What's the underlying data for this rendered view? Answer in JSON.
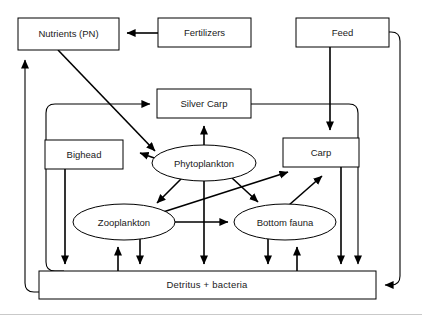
{
  "diagram": {
    "type": "flow-diagram",
    "background": "#ffffff",
    "line_color": "#000000",
    "node_fill": "#ffffff",
    "nodes": [
      {
        "id": "nutrients",
        "label": "Nutrients (PN)",
        "shape": "rect",
        "x": 18,
        "y": 18,
        "w": 101,
        "h": 32
      },
      {
        "id": "fertilizers",
        "label": "Fertilizers",
        "shape": "rect",
        "x": 158,
        "y": 18,
        "w": 93,
        "h": 29
      },
      {
        "id": "feed",
        "label": "Feed",
        "shape": "rect",
        "x": 296,
        "y": 18,
        "w": 93,
        "h": 29
      },
      {
        "id": "silvercarp",
        "label": "Silver Carp",
        "shape": "rect",
        "x": 157,
        "y": 89,
        "w": 94,
        "h": 29
      },
      {
        "id": "bighead",
        "label": "Bighead",
        "shape": "rect",
        "x": 45,
        "y": 140,
        "w": 78,
        "h": 29
      },
      {
        "id": "carp",
        "label": "Carp",
        "shape": "rect",
        "x": 283,
        "y": 138,
        "w": 76,
        "h": 29
      },
      {
        "id": "phytoplankton",
        "label": "Phytoplankton",
        "shape": "ellipse",
        "cx": 204,
        "cy": 163,
        "rx": 52,
        "ry": 18
      },
      {
        "id": "zooplankton",
        "label": "Zooplankton",
        "shape": "ellipse",
        "cx": 124,
        "cy": 222,
        "rx": 51,
        "ry": 18
      },
      {
        "id": "bottomfauna",
        "label": "Bottom fauna",
        "shape": "ellipse",
        "cx": 285,
        "cy": 222,
        "rx": 51,
        "ry": 18
      },
      {
        "id": "detritus",
        "label": "Detritus  +  bacteria",
        "shape": "rect",
        "x": 39,
        "y": 271,
        "w": 337,
        "h": 28
      }
    ],
    "edges": [
      {
        "from": "fertilizers",
        "to": "nutrients",
        "kind": "straight"
      },
      {
        "from": "nutrients",
        "to": "phytoplankton",
        "kind": "diagonal"
      },
      {
        "from": "feed",
        "to": "carp",
        "kind": "straight"
      },
      {
        "from": "feed",
        "to": "detritus",
        "kind": "routed-right"
      },
      {
        "from": "detritus",
        "to": "nutrients",
        "kind": "routed-left"
      },
      {
        "from": "detritus",
        "to": "silvercarp",
        "kind": "routed-left-inner"
      },
      {
        "from": "silvercarp",
        "to": "detritus",
        "kind": "routed-right-inner"
      },
      {
        "from": "phytoplankton",
        "to": "silvercarp",
        "kind": "straight"
      },
      {
        "from": "phytoplankton",
        "to": "bighead",
        "kind": "diagonal"
      },
      {
        "from": "phytoplankton",
        "to": "zooplankton",
        "kind": "diagonal"
      },
      {
        "from": "phytoplankton",
        "to": "bottomfauna",
        "kind": "diagonal"
      },
      {
        "from": "phytoplankton",
        "to": "detritus",
        "kind": "straight"
      },
      {
        "from": "zooplankton",
        "to": "bottomfauna",
        "kind": "straight"
      },
      {
        "from": "zooplankton",
        "to": "carp",
        "kind": "diagonal-long"
      },
      {
        "from": "zooplankton",
        "to": "detritus",
        "kind": "straight"
      },
      {
        "from": "detritus",
        "to": "zooplankton",
        "kind": "straight"
      },
      {
        "from": "bottomfauna",
        "to": "carp",
        "kind": "diagonal"
      },
      {
        "from": "bottomfauna",
        "to": "detritus",
        "kind": "straight"
      },
      {
        "from": "detritus",
        "to": "bottomfauna",
        "kind": "straight"
      },
      {
        "from": "bighead",
        "to": "detritus",
        "kind": "straight"
      },
      {
        "from": "carp",
        "to": "detritus",
        "kind": "straight"
      }
    ]
  }
}
